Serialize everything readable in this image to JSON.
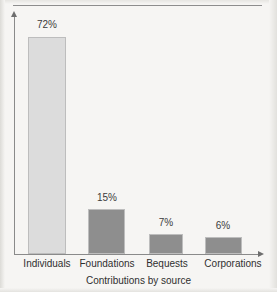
{
  "figure": {
    "background_color": "#f6f5f3",
    "rule_color": "#8d8d8d",
    "axis_color": "#8a8a8a"
  },
  "chart_data": {
    "type": "bar",
    "title": "",
    "subtitle": "",
    "xlabel": "Contributions by source",
    "ylabel": "",
    "categories": [
      "Individuals",
      "Foundations",
      "Bequests",
      "Corporations"
    ],
    "values": [
      72,
      15,
      7,
      6
    ],
    "value_labels": [
      "72%",
      "15%",
      "7%",
      "6%"
    ],
    "unit": "%",
    "ylim": [
      0,
      80
    ],
    "grid": false,
    "legend": null,
    "bar_colors": [
      "#dcdcdc",
      "#8e8e8e",
      "#8e8e8e",
      "#8e8e8e"
    ],
    "bar_border_color": "#bdbdbd",
    "annotations": []
  },
  "bars": [
    {
      "category": "Individuals",
      "value": 72,
      "label": "72%",
      "color": "#dcdcdc",
      "left_px": 28,
      "width_px": 38,
      "height_px": 217,
      "label_left_px": 20,
      "label_top_px": 19,
      "label_width_px": 54,
      "cat_left_px": 0,
      "cat_width_px": 94
    },
    {
      "category": "Foundations",
      "value": 15,
      "label": "15%",
      "color": "#8e8e8e",
      "left_px": 88,
      "width_px": 37,
      "height_px": 45,
      "label_left_px": 80,
      "label_top_px": 192,
      "label_width_px": 54,
      "cat_left_px": 62,
      "cat_width_px": 90
    },
    {
      "category": "Bequests",
      "value": 7,
      "label": "7%",
      "color": "#8e8e8e",
      "left_px": 149,
      "width_px": 34,
      "height_px": 20,
      "label_left_px": 139,
      "label_top_px": 217,
      "label_width_px": 54,
      "cat_left_px": 132,
      "cat_width_px": 70
    },
    {
      "category": "Corporations",
      "value": 6,
      "label": "6%",
      "color": "#8e8e8e",
      "left_px": 205,
      "width_px": 37,
      "height_px": 17,
      "label_left_px": 196,
      "label_top_px": 220,
      "label_width_px": 54,
      "cat_left_px": 188,
      "cat_width_px": 90
    }
  ]
}
